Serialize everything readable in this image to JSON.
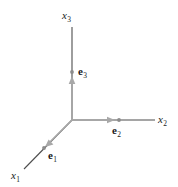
{
  "figure": {
    "background_color": "#ffffff",
    "width": 178,
    "height": 187
  },
  "colors": {
    "axis_line": "#4d4d4d",
    "vector_line": "#a8a8a8",
    "tick_dot": "#8c8c8c",
    "label_text": "#1a1a1a"
  },
  "geometry": {
    "origin": {
      "x": 72,
      "y": 120
    },
    "axes": [
      {
        "id": "x1",
        "direction": "down-left",
        "from": {
          "x": 72,
          "y": 120
        },
        "to": {
          "x": 24,
          "y": 169
        }
      },
      {
        "id": "x2",
        "direction": "right",
        "from": {
          "x": 72,
          "y": 120
        },
        "to": {
          "x": 155,
          "y": 120
        }
      },
      {
        "id": "x3",
        "direction": "up",
        "from": {
          "x": 72,
          "y": 120
        },
        "to": {
          "x": 72,
          "y": 27
        }
      }
    ],
    "vectors": [
      {
        "id": "e1",
        "from": {
          "x": 72,
          "y": 120
        },
        "to": {
          "x": 46,
          "y": 146
        },
        "tip_dot": {
          "x": 44,
          "y": 148
        }
      },
      {
        "id": "e2",
        "from": {
          "x": 72,
          "y": 120
        },
        "to": {
          "x": 115,
          "y": 120
        },
        "tip_dot": {
          "x": 119,
          "y": 120
        }
      },
      {
        "id": "e3",
        "from": {
          "x": 72,
          "y": 120
        },
        "to": {
          "x": 72,
          "y": 78
        },
        "tip_dot": {
          "x": 72,
          "y": 72
        }
      }
    ]
  },
  "labels": {
    "axis": [
      {
        "id": "x1",
        "symbol": "x",
        "subscript": "1",
        "x": 11,
        "y": 170
      },
      {
        "id": "x2",
        "symbol": "x",
        "subscript": "2",
        "x": 158,
        "y": 114
      },
      {
        "id": "x3",
        "symbol": "x",
        "subscript": "3",
        "x": 62,
        "y": 10
      }
    ],
    "vector": [
      {
        "id": "e1",
        "symbol": "e",
        "subscript": "1",
        "x": 48,
        "y": 150
      },
      {
        "id": "e2",
        "symbol": "e",
        "subscript": "2",
        "x": 112,
        "y": 125
      },
      {
        "id": "e3",
        "symbol": "e",
        "subscript": "3",
        "x": 78,
        "y": 66
      }
    ]
  }
}
